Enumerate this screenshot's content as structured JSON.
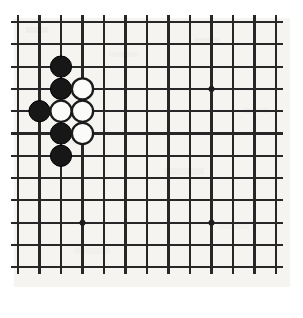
{
  "app": {
    "title": "Go Board Diagram",
    "kind": "goban-position-diagram"
  },
  "board": {
    "label": "go-board",
    "description": "Partial Go board showing a local joseki fight in the upper left",
    "visible_columns": 13,
    "visible_rows": 12,
    "background_color": "#f5f4f1",
    "line_color": "#272727",
    "page_background": "#ffffff",
    "origin_x": 18,
    "origin_y": 22,
    "spacing_x": 21.5,
    "spacing_y": 22.3,
    "line_overshoot": 7,
    "stone_radius": 10.6,
    "star_radius": 3.0
  },
  "star_points": [
    {
      "name": "star-point-upper-right",
      "col": 9,
      "row": 3
    },
    {
      "name": "star-point-lower-left",
      "col": 3,
      "row": 9
    },
    {
      "name": "star-point-lower-right",
      "col": 9,
      "row": 9
    }
  ],
  "stones": [
    {
      "name": "stone-black-1",
      "color": "black",
      "col": 2,
      "row": 2
    },
    {
      "name": "stone-black-2",
      "color": "black",
      "col": 2,
      "row": 3
    },
    {
      "name": "stone-white-1",
      "color": "white",
      "col": 3,
      "row": 3
    },
    {
      "name": "stone-black-3",
      "color": "black",
      "col": 1,
      "row": 4
    },
    {
      "name": "stone-white-2",
      "color": "white",
      "col": 2,
      "row": 4
    },
    {
      "name": "stone-white-3",
      "color": "white",
      "col": 3,
      "row": 4
    },
    {
      "name": "stone-black-4",
      "color": "black",
      "col": 2,
      "row": 5
    },
    {
      "name": "stone-white-4",
      "color": "white",
      "col": 3,
      "row": 5
    },
    {
      "name": "stone-black-5",
      "color": "black",
      "col": 2,
      "row": 6
    }
  ],
  "counts": {
    "black_stones": 5,
    "white_stones": 4,
    "total_stones": 9
  },
  "colors": {
    "black_stone": "#171717",
    "white_stone": "#fbfbfa",
    "stone_outline": "#1b1b1b",
    "grid": "#272727",
    "star": "#1c1c1c"
  }
}
